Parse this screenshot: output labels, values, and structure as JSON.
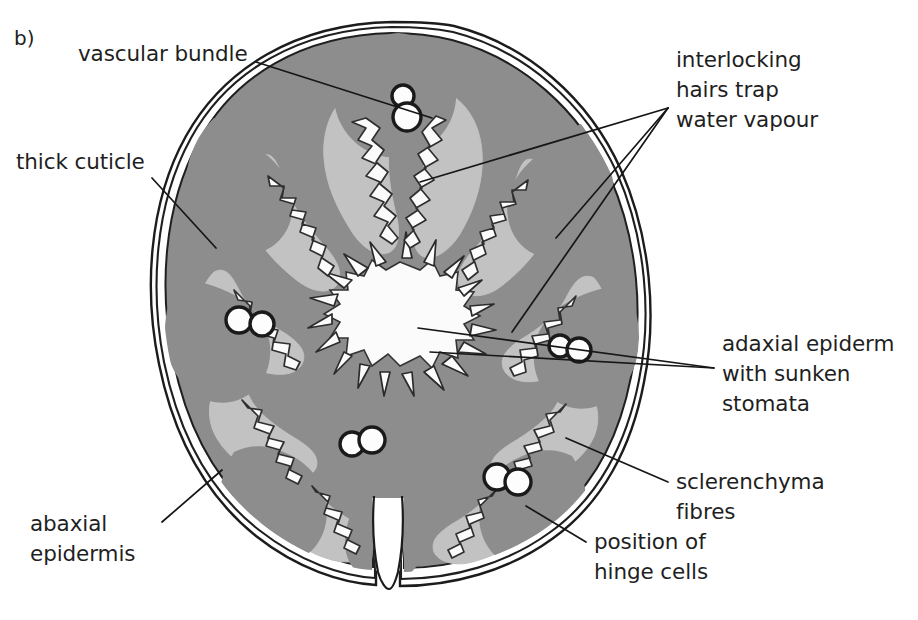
{
  "figure": {
    "panel_letter": "b)",
    "colors": {
      "background": "#ffffff",
      "outline": "#1a1a1a",
      "cuticle_line": "#222222",
      "mesophyll_dark_grey": "#8d8d8d",
      "ridge_light_grey": "#c2c2c2",
      "cavity_white": "#fbfbfb",
      "vascular_white": "#fdfdfd",
      "leader_line": "#161616",
      "text": "#1f1f1f"
    }
  },
  "labels": [
    {
      "id": "vascular-bundle",
      "text": "vascular bundle",
      "lines": [
        "vascular bundle"
      ],
      "x": 78,
      "y": 40,
      "leader": [
        [
          256,
          62
        ],
        [
          432,
          118
        ]
      ]
    },
    {
      "id": "thick-cuticle",
      "text": "thick cuticle",
      "lines": [
        "thick cuticle"
      ],
      "x": 16,
      "y": 148,
      "leader": [
        [
          152,
          178
        ],
        [
          216,
          248
        ]
      ]
    },
    {
      "id": "interlocking-hairs",
      "text": "interlocking hairs trap water vapour",
      "lines": [
        "interlocking",
        "hairs trap",
        "water vapour"
      ],
      "x": 676,
      "y": 46,
      "leader_fan": [
        [
          [
            668,
            108
          ],
          [
            420,
            180
          ]
        ],
        [
          [
            668,
            108
          ],
          [
            556,
            238
          ]
        ],
        [
          [
            668,
            108
          ],
          [
            512,
            330
          ]
        ]
      ]
    },
    {
      "id": "adaxial-epidermis",
      "text": "adaxial epiderm",
      "lines": [
        "adaxial epiderm",
        "with sunken",
        "stomata"
      ],
      "x": 722,
      "y": 330,
      "clipped_at_right_edge": true,
      "leader_fan": [
        [
          [
            714,
            368
          ],
          [
            420,
            330
          ]
        ],
        [
          [
            714,
            368
          ],
          [
            430,
            352
          ]
        ]
      ]
    },
    {
      "id": "sclerenchyma-fibres",
      "text": "sclerenchyma fibres",
      "lines": [
        "sclerenchyma",
        "fibres"
      ],
      "x": 676,
      "y": 468,
      "leader": [
        [
          668,
          482
        ],
        [
          566,
          438
        ]
      ]
    },
    {
      "id": "position-of-hinge-cells",
      "text": "position of hinge cells",
      "lines": [
        "position of",
        "hinge cells"
      ],
      "x": 594,
      "y": 528,
      "leader": [
        [
          586,
          542
        ],
        [
          528,
          508
        ]
      ]
    },
    {
      "id": "abaxial-epidermis",
      "text": "abaxial epidermis",
      "lines": [
        "abaxial",
        "epidermis"
      ],
      "x": 30,
      "y": 510,
      "leader": [
        [
          162,
          522
        ],
        [
          222,
          472
        ]
      ]
    }
  ]
}
